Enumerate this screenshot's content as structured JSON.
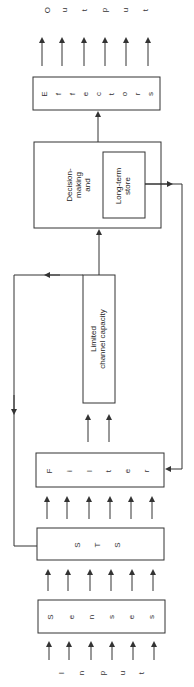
{
  "diagram": {
    "output_label": [
      "O",
      "u",
      "t",
      "p",
      "u",
      "t"
    ],
    "input_label": [
      "I",
      "n",
      "p",
      "u",
      "t"
    ],
    "boxes": {
      "effectors": [
        "E",
        "f",
        "f",
        "e",
        "c",
        "t",
        "o",
        "r",
        "s"
      ],
      "decision": {
        "line1": "Decision-",
        "line2": "making",
        "line3": "and"
      },
      "long_term_store": {
        "line1": "Long-term",
        "line2": "store"
      },
      "limited_channel": {
        "line1": "Limited",
        "line2": "channel capacity"
      },
      "filter": [
        "F",
        "i",
        "l",
        "t",
        "e",
        "r"
      ],
      "sts": [
        "S",
        "T",
        "S"
      ],
      "senses": [
        "S",
        "e",
        "n",
        "s",
        "e",
        "s"
      ]
    },
    "colors": {
      "line": "#333333",
      "background": "#ffffff"
    }
  }
}
